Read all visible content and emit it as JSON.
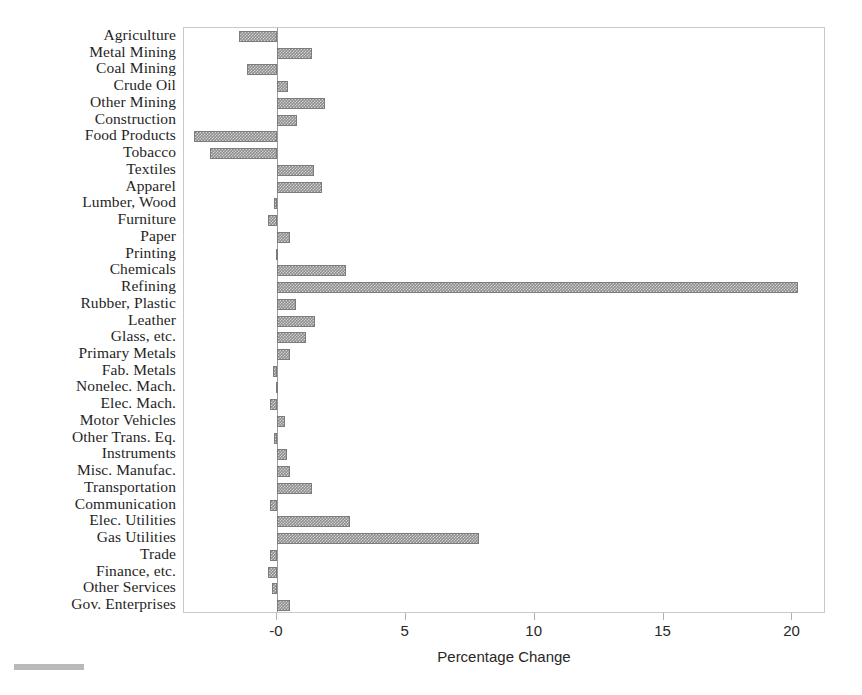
{
  "chart_data": {
    "type": "bar",
    "orientation": "horizontal",
    "title": "",
    "xlabel": "Percentage Change",
    "ylabel": "",
    "xlim": [
      -3.6,
      21.3
    ],
    "xticks": [
      0,
      5,
      10,
      15,
      20
    ],
    "xtick_labels": [
      "-0",
      "5",
      "10",
      "15",
      "20"
    ],
    "grid": false,
    "legend": null,
    "bar_color": "#8e8e8e",
    "categories": [
      "Agriculture",
      "Metal Mining",
      "Coal Mining",
      "Crude Oil",
      "Other Mining",
      "Construction",
      "Food Products",
      "Tobacco",
      "Textiles",
      "Apparel",
      "Lumber, Wood",
      "Furniture",
      "Paper",
      "Printing",
      "Chemicals",
      "Refining",
      "Rubber, Plastic",
      "Leather",
      "Glass, etc.",
      "Primary Metals",
      "Fab. Metals",
      "Nonelec. Mach.",
      "Elec. Mach.",
      "Motor Vehicles",
      "Other Trans. Eq.",
      "Instruments",
      "Misc. Manufac.",
      "Transportation",
      "Communication",
      "Elec. Utilities",
      "Gas Utilities",
      "Trade",
      "Finance, etc.",
      "Other Services",
      "Gov. Enterprises"
    ],
    "values": [
      -1.45,
      1.35,
      -1.15,
      0.45,
      1.85,
      0.8,
      -3.2,
      -2.6,
      1.45,
      1.75,
      -0.1,
      -0.35,
      0.5,
      -0.05,
      2.7,
      20.2,
      0.75,
      1.5,
      1.15,
      0.5,
      -0.15,
      -0.05,
      -0.25,
      0.3,
      -0.1,
      0.4,
      0.5,
      1.35,
      -0.25,
      2.85,
      7.85,
      -0.25,
      -0.35,
      -0.2,
      0.5
    ]
  }
}
